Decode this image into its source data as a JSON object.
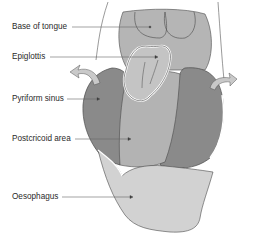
{
  "diagram": {
    "labels": [
      {
        "id": "base-of-tongue",
        "text": "Base of tongue",
        "x": 12,
        "y": 22
      },
      {
        "id": "epiglottis",
        "text": "Epiglottis",
        "x": 12,
        "y": 52
      },
      {
        "id": "pyriform-sinus",
        "text": "Pyriform sinus",
        "x": 12,
        "y": 94
      },
      {
        "id": "postcricoid-area",
        "text": "Postcricoid area",
        "x": 12,
        "y": 134
      },
      {
        "id": "oesophagus",
        "text": "Oesophagus",
        "x": 12,
        "y": 192
      }
    ],
    "colors": {
      "tongue": "#b5b5b5",
      "epiglottis": "#c4c4c4",
      "pyriform_sinus": "#8a8a8a",
      "postcricoid": "#b3b3b3",
      "oesophagus": "#d2d2d2",
      "arrow": "#c9c9c9",
      "outline": "#4a4a4a",
      "leader": "#666666"
    }
  }
}
